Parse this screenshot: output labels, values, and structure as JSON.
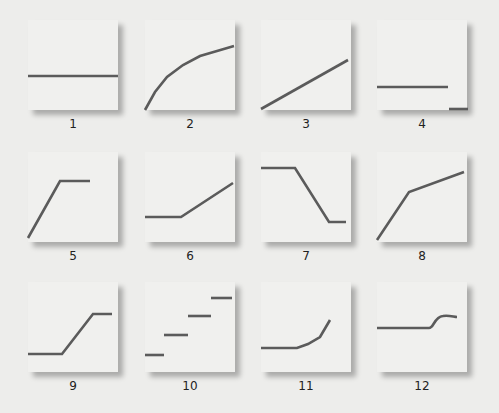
{
  "diagram": {
    "panel_size": 90,
    "line_color": "#5b5b5b",
    "panel_color": "#f0f0ee",
    "background": "#ededeb",
    "panels": [
      {
        "label": "1",
        "x": 28,
        "y": 20,
        "shape": "constant",
        "points": "0,56 90,56"
      },
      {
        "label": "2",
        "x": 145,
        "y": 20,
        "shape": "concave-increasing",
        "points": "0,90 10,72 22,57 38,45 55,36 72,31 89,26"
      },
      {
        "label": "3",
        "x": 261,
        "y": 20,
        "shape": "linear-increasing",
        "points": "0,89 87,40"
      },
      {
        "label": "4",
        "x": 377,
        "y": 20,
        "shape": "step-down",
        "points": "0,67 71,67",
        "points2": "72,89 91,89"
      },
      {
        "label": "5",
        "x": 28,
        "y": 152,
        "shape": "increase-then-plateau",
        "points": "0,86 32,29 62,29"
      },
      {
        "label": "6",
        "x": 145,
        "y": 152,
        "shape": "flat-then-increase",
        "points": "0,65 36,65 88,31"
      },
      {
        "label": "7",
        "x": 261,
        "y": 152,
        "shape": "flat-decrease-flat",
        "points": "0,16 34,16 68,70 85,70"
      },
      {
        "label": "8",
        "x": 377,
        "y": 152,
        "shape": "steep-then-gentle-increase",
        "points": "0,88 32,40 87,20"
      },
      {
        "label": "9",
        "x": 28,
        "y": 282,
        "shape": "flat-increase-flat",
        "points": "0,72 34,72 65,32 84,32"
      },
      {
        "label": "10",
        "x": 145,
        "y": 282,
        "shape": "staircase",
        "steps": [
          "0,73 19,73",
          "19,53 43,53",
          "43,34 66,34",
          "66,16 87,16"
        ]
      },
      {
        "label": "11",
        "x": 261,
        "y": 282,
        "shape": "flat-then-accelerating",
        "points": "0,66 36,66 47,62 59,55 69,38"
      },
      {
        "label": "12",
        "x": 377,
        "y": 282,
        "shape": "flat-sigmoid-step",
        "path": "M0,46 L52,46 C57,46 57,35 66,34 C72,33 77,35 80,35"
      }
    ]
  }
}
